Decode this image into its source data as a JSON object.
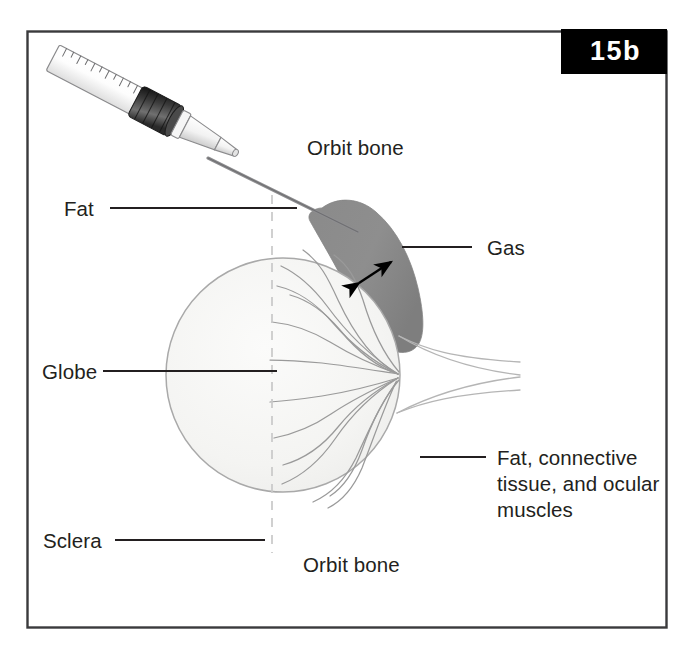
{
  "figure": {
    "badge": {
      "text": "15b",
      "background_color": "#000000",
      "text_color": "#ffffff"
    },
    "frame": {
      "border_color": "#3a3a3c",
      "background_color": "#ffffff"
    },
    "title_alt": "Retrobulbar gas injection into the orbit",
    "labels": [
      {
        "id": "orbit-bone-top",
        "text": "Orbit bone",
        "x": 307,
        "y": 147,
        "leader": false
      },
      {
        "id": "fat",
        "text": "Fat",
        "x": 64,
        "y": 197,
        "leader": true
      },
      {
        "id": "gas",
        "text": "Gas",
        "x": 487,
        "y": 237,
        "leader": true
      },
      {
        "id": "globe",
        "text": "Globe",
        "x": 42,
        "y": 360,
        "leader": true
      },
      {
        "id": "fat-connective-tissue-ocular-muscles",
        "text": "Fat, connective\ntissue, and ocular\nmuscles",
        "x": 497,
        "y": 447,
        "leader": true
      },
      {
        "id": "sclera",
        "text": "Sclera",
        "x": 43,
        "y": 527,
        "leader": true
      },
      {
        "id": "orbit-bone-bottom",
        "text": "Orbit bone",
        "x": 303,
        "y": 553,
        "leader": false
      }
    ],
    "colors": {
      "gas_fill": "#8c8c8c",
      "gas_stroke": "#8c8c8c",
      "globe_fill": "#f4f4f2",
      "globe_stroke": "#a9a9a9",
      "vessel_stroke": "#9a9a9a",
      "dashed_midline": "#c8c8c8",
      "leader_line": "#231f20",
      "needle": "#8e8e90",
      "syringe_barrel": "#fbfbfb",
      "syringe_outline": "#8a8a8c",
      "plunger_dark": "#2a2a2a",
      "arrow": "#000000",
      "nerve_stroke": "#b5b5b5"
    },
    "annotations": {
      "gas_thickness_arrow": "double-headed arrow indicating gas layer thickness"
    }
  }
}
